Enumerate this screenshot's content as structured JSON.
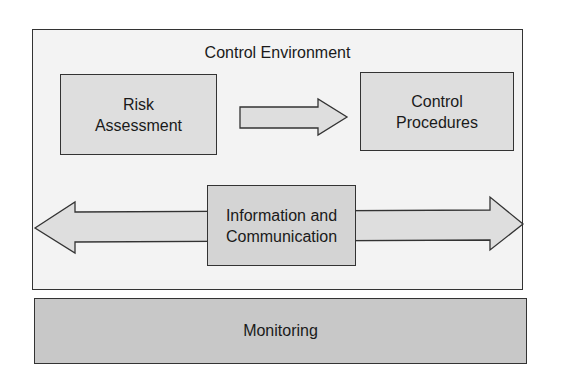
{
  "diagram": {
    "container_label": "Control Environment",
    "nodes": [
      {
        "id": "risk",
        "label": "Risk\nAssessment"
      },
      {
        "id": "control",
        "label": "Control\nProcedures"
      },
      {
        "id": "info",
        "label": "Information and\nCommunication"
      }
    ],
    "footer_label": "Monitoring",
    "edges": [
      {
        "from": "risk",
        "to": "control",
        "type": "single-arrow"
      },
      {
        "from": "container-left",
        "to": "container-right",
        "type": "double-arrow",
        "through": "info"
      }
    ],
    "colors": {
      "container_fill": "#f3f3f3",
      "node_fill": "#dedede",
      "footer_fill": "#c8c8c8",
      "stroke": "#333333"
    }
  }
}
